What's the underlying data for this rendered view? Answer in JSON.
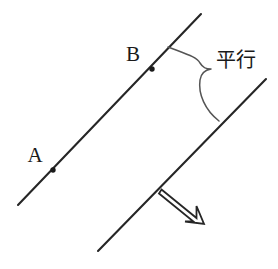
{
  "figure": {
    "background_color": "#ffffff",
    "line_color": "#262626",
    "brace_color": "#555555",
    "text_color": "#1a1a1a",
    "width": 278,
    "height": 269
  },
  "lines": [
    {
      "name": "upper-line",
      "x1": 18,
      "y1": 205,
      "x2": 201,
      "y2": 14,
      "stroke_width": 2.1
    },
    {
      "name": "lower-line",
      "x1": 98,
      "y1": 251,
      "x2": 266,
      "y2": 79,
      "stroke_width": 2.1
    }
  ],
  "points": [
    {
      "label": "A",
      "cx": 53,
      "cy": 170,
      "r": 2.6,
      "label_x": 35,
      "label_y": 162
    },
    {
      "label": "B",
      "cx": 152,
      "cy": 69,
      "r": 2.6,
      "label_x": 133,
      "label_y": 61
    }
  ],
  "brace": {
    "name": "parallel-brace",
    "start_x": 168,
    "start_y": 47,
    "tip_x": 211,
    "tip_y": 69,
    "end_x": 219,
    "end_y": 121,
    "path": "M 168 47 C 186 54 197 57 200 63 C 203 68 206 69 211 69 C 205 70 201 73 200 80 C 198 94 205 110 219 121"
  },
  "annotation": {
    "name": "parallel-text",
    "text": "平行",
    "x": 216,
    "y": 67
  },
  "arrow": {
    "name": "direction-arrow",
    "description": "hollow outlined arrow pointing down-right along the lower line direction",
    "points": "163,191 196,217 196,207 203,222 186,221 194,221 161,194",
    "outline_path": "M 162.5 190.5 L 195.5 217.5 L 195.5 204.5 L 203.5 223.5 L 184.0 221.0 L 194.0 221.0 L 160.0 194.5 Z",
    "stroke_width": 1.8
  }
}
